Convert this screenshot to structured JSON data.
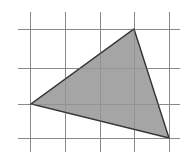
{
  "figure": {
    "canvas": {
      "width": 195,
      "height": 163,
      "background": "#ffffff"
    },
    "grid": {
      "line_color": "#8a8a8a",
      "line_width": 1,
      "spacing": 35,
      "vertical_x": [
        30,
        65,
        100,
        134,
        169
      ],
      "horizontal_y": [
        29,
        68,
        104,
        138
      ],
      "vertical_extent": {
        "y1": 12,
        "y2": 152
      },
      "horizontal_extent": {
        "x1": 18,
        "x2": 180
      }
    },
    "shape": {
      "name": "triangle",
      "fill_color": "#999999",
      "fill_opacity": 0.88,
      "stroke_color": "#333333",
      "stroke_width": 1.4,
      "points": "134,29 169,138 31,104",
      "vertices": [
        {
          "label": "apex",
          "x": 134,
          "y": 29
        },
        {
          "label": "bottom-right",
          "x": 169,
          "y": 138
        },
        {
          "label": "left",
          "x": 31,
          "y": 104
        }
      ]
    }
  }
}
